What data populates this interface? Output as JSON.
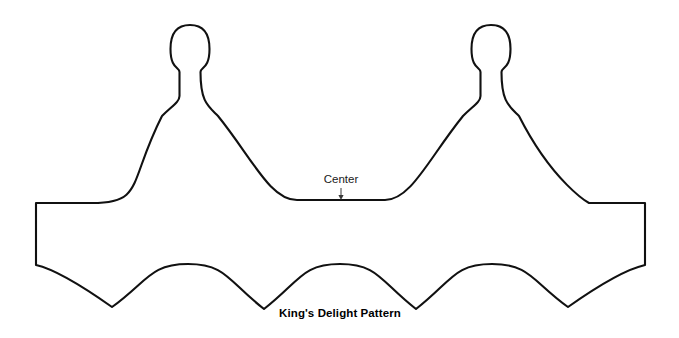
{
  "document": {
    "kind": "sewing-pattern-diagram",
    "background_color": "#ffffff",
    "line_color": "#111111",
    "width": 679,
    "height": 338
  },
  "title": {
    "text": "King's Delight Pattern",
    "x": 340,
    "y": 317
  },
  "annotations": {
    "center": {
      "label": "Center",
      "label_x": 341,
      "label_y": 183,
      "arrow_from_y": 188,
      "arrow_to_y": 200,
      "arrow_x": 341
    }
  },
  "fold_lines": [
    {
      "name": "left-fold-line",
      "x": 36,
      "y1": 203,
      "y2": 265,
      "dash": "14 4 3 4"
    },
    {
      "name": "right-fold-line",
      "x": 645,
      "y1": 203,
      "y2": 265,
      "dash": "14 4 3 4"
    }
  ],
  "geometry": {
    "left_edge_x": 36,
    "right_edge_x": 645,
    "body_top_y": 203,
    "body_bottom_y": 265,
    "finials": [
      {
        "name": "left-finial",
        "center_x": 190,
        "top_y": 25,
        "neck_y": 100
      },
      {
        "name": "right-finial",
        "center_x": 491,
        "top_y": 25,
        "neck_y": 100
      }
    ],
    "center_valley": {
      "x": 341,
      "y": 200
    },
    "scallops": [
      {
        "name": "scallop-1",
        "peak_x": 63,
        "valley_x": 112,
        "valley_y": 307
      },
      {
        "name": "scallop-2",
        "peak_x": 188,
        "valley_x": 264,
        "valley_y": 309
      },
      {
        "name": "scallop-3",
        "peak_x": 340,
        "valley_x": 416,
        "valley_y": 309
      },
      {
        "name": "scallop-4",
        "peak_x": 492,
        "valley_x": 568,
        "valley_y": 307
      }
    ]
  },
  "outline_path": "M 36 203 L 92 203 C 118 203 132 196 146 177 C 160 158 168 132 174 118 C 178 108 180 103 180 100 L 180 70 C 174 64 172 56 172 48 C 172 33 180 25 190 25 C 201 25 209 33 209 48 C 209 56 207 64 201 70 L 201 100 C 201 103 203 108 207 118 C 213 132 221 158 235 177 C 249 196 263 200 285 200 L 341 200 L 396 200 C 418 200 432 196 446 177 C 460 158 468 132 474 118 C 478 108 480 103 480 100 L 480 70 C 474 64 472 56 472 48 C 472 33 480 25 491 25 C 501 25 509 33 509 48 C 509 56 507 64 501 70 L 501 100 C 501 103 503 108 507 118 C 513 132 521 158 535 177 C 549 196 563 203 589 203 L 645 203 L 645 265 L 589 265 C 563 265 540 272 520 286 C 500 300 576 309 568 307 C 560 305 534 290 516 277 C 498 264 478 265 454 265 C 430 265 410 264 392 277 C 374 290 424 309 416 309 C 408 309 380 290 362 277 C 344 264 324 265 300 265 C 276 265 256 264 238 277 C 220 290 272 309 264 309 C 256 309 228 290 210 277 C 192 264 172 265 148 265 C 124 265 101 272 81 286 C 61 300 120 309 112 307 C 104 305 78 290 60 277 C 48 269 44 265 36 265 Z"
}
